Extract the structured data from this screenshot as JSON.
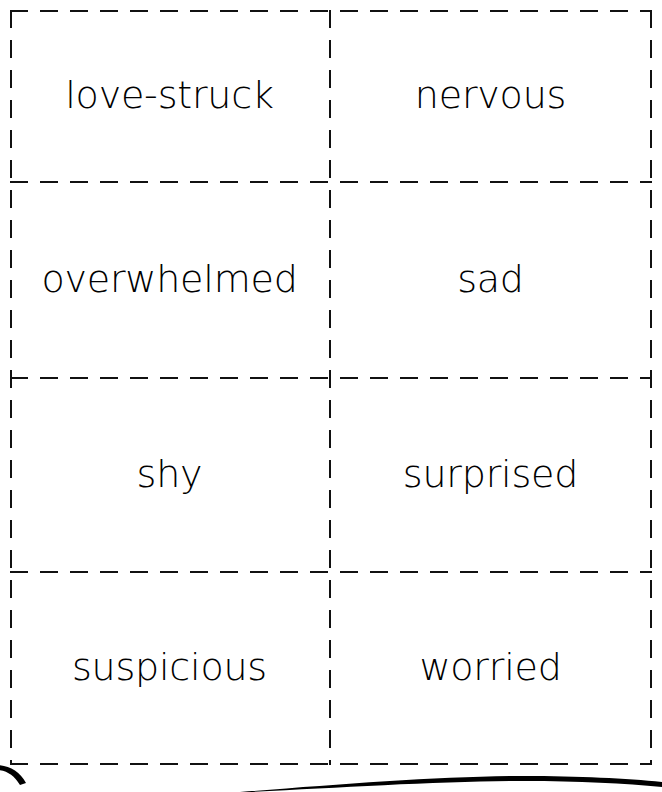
{
  "page": {
    "background_color": "#ffffff",
    "ink_color": "#000000",
    "guide_color": "#111111",
    "columns": 2,
    "rows": 4
  },
  "cards": [
    {
      "id": "card-love-struck",
      "label": "love-struck",
      "row": 1,
      "column": 1
    },
    {
      "id": "card-nervous",
      "label": "nervous",
      "row": 1,
      "column": 2
    },
    {
      "id": "card-overwhelmed",
      "label": "overwhelmed",
      "row": 2,
      "column": 1
    },
    {
      "id": "card-sad",
      "label": "sad",
      "row": 2,
      "column": 2
    },
    {
      "id": "card-shy",
      "label": "shy",
      "row": 3,
      "column": 1
    },
    {
      "id": "card-surprised",
      "label": "surprised",
      "row": 3,
      "column": 2
    },
    {
      "id": "card-suspicious",
      "label": "suspicious",
      "row": 4,
      "column": 1
    },
    {
      "id": "card-worried",
      "label": "worried",
      "row": 4,
      "column": 2
    }
  ],
  "decoration": {
    "bottom_curve_color": "#000000",
    "left_hook_color": "#000000"
  }
}
